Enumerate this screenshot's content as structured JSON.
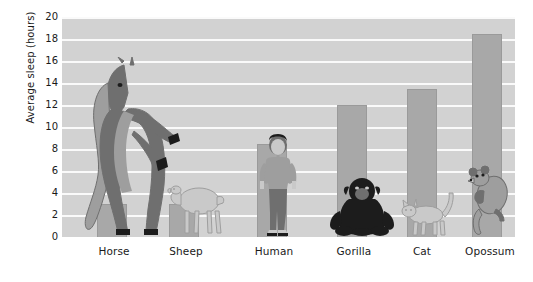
{
  "chart_data": {
    "type": "bar",
    "title": "",
    "subtitle": "",
    "xlabel": "",
    "ylabel": "Average sleep (hours)",
    "categories": [
      "Horse",
      "Sheep",
      "Human",
      "Gorilla",
      "Cat",
      "Opossum"
    ],
    "values": [
      3,
      3,
      8.5,
      12,
      13.5,
      18.5
    ],
    "series": [
      {
        "name": "Average sleep",
        "values": [
          3,
          3,
          8.5,
          12,
          13.5,
          18.5
        ]
      }
    ],
    "ylim": [
      0,
      20
    ],
    "ytick_step": 2,
    "ytick_labels": [
      "0",
      "2",
      "4",
      "6",
      "8",
      "10",
      "12",
      "14",
      "16",
      "18",
      "20"
    ],
    "grid": true,
    "grid_axis": "y",
    "legend": false,
    "legend_position": "none",
    "annotations": [
      "Each bar is overlaid with a drawing of the animal it represents."
    ],
    "colors": {
      "bar_fill": "#a8a8a8",
      "bar_edge": "#9a9a9a",
      "plot_background": "#d2d2d2",
      "gridline": "#fafafa",
      "page_background": "#ffffff",
      "text": "#1a1a1a",
      "animal_light": "#c9c9c9",
      "animal_mid": "#9e9e9e",
      "animal_dark": "#6f6f6f",
      "animal_black": "#1c1c1c"
    }
  },
  "axis": {
    "y_title": "Average sleep (hours)",
    "y_ticks": [
      {
        "label": "20",
        "value": 20
      },
      {
        "label": "18",
        "value": 18
      },
      {
        "label": "16",
        "value": 16
      },
      {
        "label": "14",
        "value": 14
      },
      {
        "label": "12",
        "value": 12
      },
      {
        "label": "10",
        "value": 10
      },
      {
        "label": "8",
        "value": 8
      },
      {
        "label": "6",
        "value": 6
      },
      {
        "label": "4",
        "value": 4
      },
      {
        "label": "2",
        "value": 2
      },
      {
        "label": "0",
        "value": 0
      }
    ]
  },
  "bars": [
    {
      "label": "Horse",
      "value": 3,
      "icon": "horse-illustration"
    },
    {
      "label": "Sheep",
      "value": 3,
      "icon": "sheep-illustration"
    },
    {
      "label": "Human",
      "value": 8.5,
      "icon": "human-illustration"
    },
    {
      "label": "Gorilla",
      "value": 12,
      "icon": "gorilla-illustration"
    },
    {
      "label": "Cat",
      "value": 13.5,
      "icon": "cat-illustration"
    },
    {
      "label": "Opossum",
      "value": 18.5,
      "icon": "opossum-illustration"
    }
  ]
}
